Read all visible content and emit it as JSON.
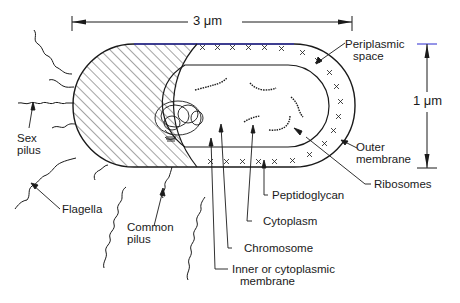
{
  "diagram": {
    "type": "labeled schematic",
    "dimensions": {
      "length": "3 μm",
      "width": "1 μm"
    },
    "labels": {
      "periplasmic_space": [
        "Periplasmic",
        "space"
      ],
      "outer_membrane": [
        "Outer",
        "membrane"
      ],
      "ribosomes": "Ribosomes",
      "peptidoglycan": "Peptidoglycan",
      "cytoplasm": "Cytoplasm",
      "chromosome": "Chromosome",
      "inner_membrane": [
        "Inner or cytoplasmic",
        "membrane"
      ],
      "sex_pilus": [
        "Sex",
        "pilus"
      ],
      "flagella": "Flagella",
      "common_pilus": [
        "Common",
        "pilus"
      ]
    },
    "colors": {
      "line": "#1a1a1a",
      "accent_top_edge": "#2a2ad0",
      "background": "#ffffff"
    }
  }
}
